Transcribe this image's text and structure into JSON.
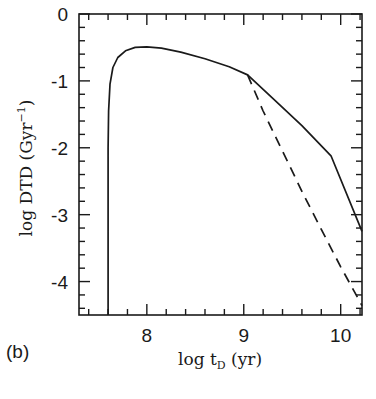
{
  "panel_label": "(b)",
  "chart_data": {
    "type": "line",
    "title": "",
    "panel": "(b)",
    "xlabel": "log t_D (yr)",
    "xlabel_parts": {
      "main": "log t",
      "sub": "D",
      "unit": " (yr)"
    },
    "ylabel": "log DTD (Gyr^-1)",
    "ylabel_parts": {
      "main": "log DTD (Gyr",
      "sup": "−1",
      "close": ")"
    },
    "xlim": [
      7.3,
      10.22
    ],
    "ylim": [
      -4.5,
      0
    ],
    "xticks": [
      8,
      9,
      10
    ],
    "xtick_labels": [
      "8",
      "9",
      "10"
    ],
    "x_minor_step": 0.2,
    "yticks": [
      0,
      -1,
      -2,
      -3,
      -4
    ],
    "ytick_labels": [
      "0",
      "-1",
      "-2",
      "-3",
      "-4"
    ],
    "y_minor_step": 0.2,
    "grid": false,
    "legend": null,
    "series": [
      {
        "name": "solid",
        "style": "solid",
        "x": [
          7.6,
          7.6,
          7.605,
          7.62,
          7.65,
          7.7,
          7.78,
          7.88,
          8.0,
          8.15,
          8.35,
          8.6,
          8.85,
          9.04,
          9.3,
          9.6,
          9.9,
          10.22
        ],
        "y": [
          -4.5,
          -2.0,
          -1.45,
          -1.05,
          -0.8,
          -0.65,
          -0.55,
          -0.5,
          -0.49,
          -0.51,
          -0.57,
          -0.67,
          -0.79,
          -0.91,
          -1.26,
          -1.67,
          -2.12,
          -3.25
        ]
      },
      {
        "name": "dashed",
        "style": "dashed",
        "x": [
          9.04,
          9.2,
          9.4,
          9.6,
          9.8,
          10.0,
          10.22
        ],
        "y": [
          -0.91,
          -1.45,
          -2.05,
          -2.65,
          -3.22,
          -3.78,
          -4.36
        ]
      }
    ]
  }
}
